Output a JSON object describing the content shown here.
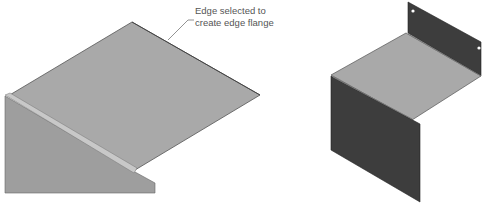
{
  "figure": {
    "callout": {
      "lines": [
        "Edge selected to",
        "create edge flange"
      ]
    },
    "colors": {
      "background": "#ffffff",
      "light_face": "#a9a9a9",
      "wall_face": "#9e9e9e",
      "bend_highlight": "#c8c8c8",
      "dark_flange": "#3d3d3d",
      "edge_line": "#555555",
      "leader_line": "#777777"
    },
    "panels": [
      {
        "id": "before",
        "description": "Sheet metal part with edge selected"
      },
      {
        "id": "after",
        "description": "Sheet metal part with edge flanges created"
      }
    ]
  }
}
